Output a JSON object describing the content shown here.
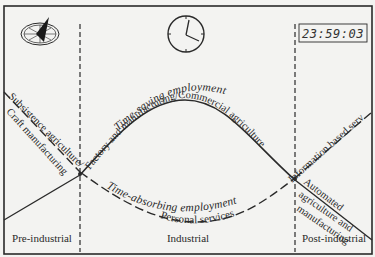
{
  "diagram": {
    "icons": {
      "sundial": "sundial-icon",
      "analog_clock": "analog-clock-icon",
      "digital_clock": "digital-clock-icon"
    },
    "digital_clock_time": "23:59:03",
    "curves": {
      "time_saving": {
        "label": "Time-saving employment",
        "style": "solid"
      },
      "time_absorbing": {
        "label": "Time-absorbing employment",
        "style": "dashed"
      }
    },
    "segment_labels": {
      "pre_industrial_dashed": "Subsistence agriculture/",
      "pre_industrial_solid": "Craft manufacturing",
      "industrial_upper": "Factory and manufacturing/Commercial agriculture",
      "industrial_lower": "Personal services",
      "post_industrial_dashed": "Information based services",
      "post_industrial_solid_1": "Automated",
      "post_industrial_solid_2": "agriculture and",
      "post_industrial_solid_3": "manufacturing"
    },
    "eras": [
      {
        "label": "Pre-industrial"
      },
      {
        "label": "Industrial"
      },
      {
        "label": "Post-industrial"
      }
    ],
    "colors": {
      "background": "#f3f3f1",
      "ink": "#2a2a2a"
    }
  }
}
